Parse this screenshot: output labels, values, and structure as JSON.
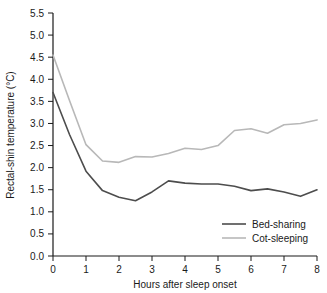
{
  "chart_data": {
    "type": "line",
    "title": "",
    "xlabel": "Hours after sleep onset",
    "ylabel": "Rectal-shin temperature (°C)",
    "xlim": [
      0,
      8
    ],
    "ylim": [
      0.0,
      5.5
    ],
    "xticks": [
      "0",
      "1",
      "2",
      "3",
      "4",
      "5",
      "6",
      "7",
      "8"
    ],
    "yticks": [
      "0.0",
      "0.5",
      "1.0",
      "1.5",
      "2.0",
      "2.5",
      "3.0",
      "3.5",
      "4.0",
      "4.5",
      "5.0",
      "5.5"
    ],
    "grid": false,
    "legend_position": "lower-right",
    "x": [
      0,
      0.5,
      1.0,
      1.5,
      2.0,
      2.5,
      3.0,
      3.5,
      4.0,
      4.5,
      5.0,
      5.5,
      6.0,
      6.5,
      7.0,
      7.5,
      8.0
    ],
    "series": [
      {
        "name": "Bed-sharing",
        "color": "#4d4d4d",
        "values": [
          3.7,
          2.75,
          1.92,
          1.48,
          1.33,
          1.25,
          1.45,
          1.7,
          1.65,
          1.63,
          1.63,
          1.58,
          1.48,
          1.52,
          1.45,
          1.35,
          1.5
        ]
      },
      {
        "name": "Cot-sleeping",
        "color": "#b8b8b8",
        "values": [
          4.55,
          3.52,
          2.52,
          2.15,
          2.12,
          2.25,
          2.24,
          2.32,
          2.44,
          2.41,
          2.5,
          2.84,
          2.88,
          2.78,
          2.97,
          3.0,
          3.08
        ]
      }
    ]
  },
  "axes": {
    "x_title": "Hours after sleep onset",
    "y_title": "Rectal-shin temperature (°C)"
  },
  "legend": {
    "entries": [
      {
        "label": "Bed-sharing"
      },
      {
        "label": "Cot-sleeping"
      }
    ]
  }
}
